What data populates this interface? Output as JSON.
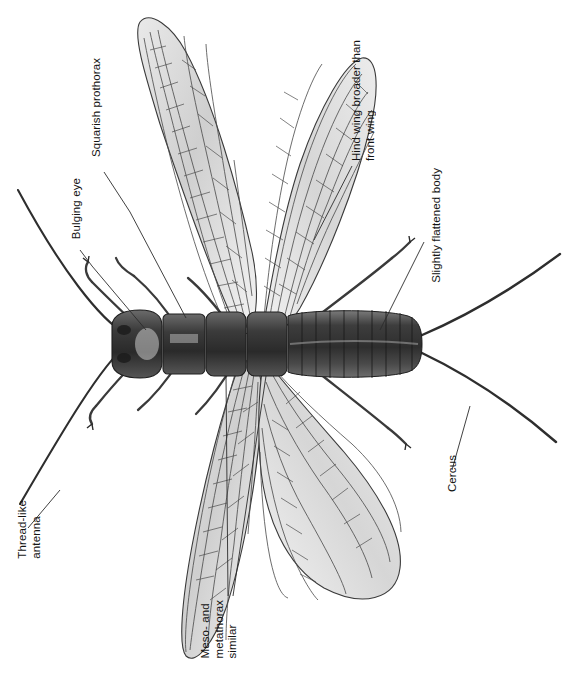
{
  "figure": {
    "kind": "scientific-illustration",
    "background_color": "#ffffff",
    "ink_color": "#2b2b2b",
    "body_color": "#4a4a4a",
    "wing_color": "#d8d8d8"
  },
  "labels": {
    "thread_like_antenna": "Thread-like\nantenna",
    "bulging_eye": "Bulging eye",
    "squarish_prothorax": "Squarish prothorax",
    "hind_wing_broader": "Hind wing broader than\nfront wing",
    "slightly_flattened_body": "Slightly flattened body",
    "cercus": "Cercus",
    "meso_and_metathorax_similar": "Meso- and\nmetathorax\nsimilar"
  },
  "callouts": [
    {
      "id": "thread-like-antenna",
      "text_key": "thread_like_antenna"
    },
    {
      "id": "bulging-eye",
      "text_key": "bulging_eye"
    },
    {
      "id": "squarish-prothorax",
      "text_key": "squarish_prothorax"
    },
    {
      "id": "hind-wing-broader-than-front-wing",
      "text_key": "hind_wing_broader"
    },
    {
      "id": "slightly-flattened-body",
      "text_key": "slightly_flattened_body"
    },
    {
      "id": "cercus",
      "text_key": "cercus"
    },
    {
      "id": "meso-and-metathorax-similar",
      "text_key": "meso_and_metathorax_similar"
    }
  ]
}
